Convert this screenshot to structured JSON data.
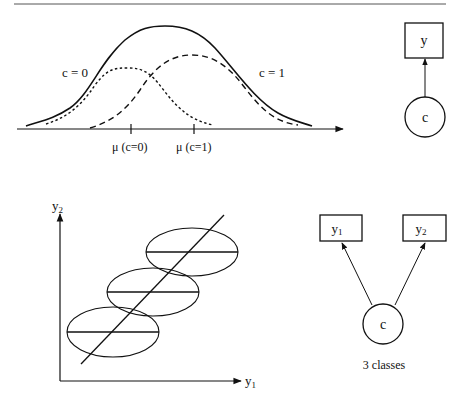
{
  "top_panel": {
    "curve_labels": {
      "left": "c = 0",
      "right": "c = 1"
    },
    "tick_labels": [
      "μ (c=0)",
      "μ (c=1)"
    ],
    "legend_desc": {
      "solid": "mixture density",
      "dotted": "class c=0 component",
      "dashed": "class c=1 component"
    }
  },
  "top_graph": {
    "observed_node": "y",
    "latent_node": "c"
  },
  "bottom_panel": {
    "y_axis_label": "y",
    "y_axis_sub": "2",
    "x_axis_label": "y",
    "x_axis_sub": "1",
    "ellipse_count": 3
  },
  "bottom_graph": {
    "observed_nodes": [
      {
        "label": "y",
        "sub": "1"
      },
      {
        "label": "y",
        "sub": "2"
      }
    ],
    "latent_node": "c",
    "caption": "3 classes"
  },
  "colors": {
    "ink": "#111111",
    "background": "#ffffff",
    "rule": "#555555"
  }
}
